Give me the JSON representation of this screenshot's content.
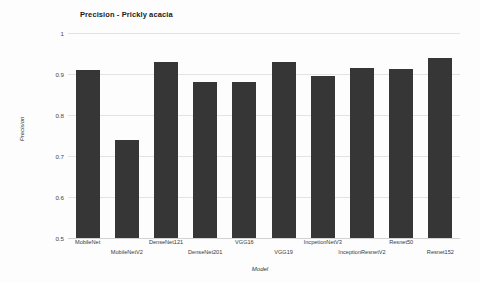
{
  "chart_data": {
    "type": "bar",
    "title": "Precision - Prickly acacia",
    "xlabel": "Model",
    "ylabel": "Precision",
    "categories": [
      "MobileNet",
      "MobileNetV2",
      "DenseNet121",
      "DenseNet201",
      "VGG16",
      "VGG19",
      "IncpetionNetV3",
      "InceptionResnetV2",
      "Resnet50",
      "Resnet152"
    ],
    "values": [
      0.91,
      0.74,
      0.93,
      0.88,
      0.88,
      0.93,
      0.895,
      0.915,
      0.912,
      0.94
    ],
    "ylim": [
      0.5,
      1.0
    ],
    "yticks": [
      "0.5",
      "0.6",
      "0.7",
      "0.8",
      "0.9",
      "1"
    ],
    "ytick_values": [
      0.5,
      0.6,
      0.7,
      0.8,
      0.9,
      1.0
    ],
    "grid": true,
    "legend": false,
    "bar_color": "#363636",
    "grid_color": "#e3e3e3",
    "background": "#fdfdfd"
  }
}
